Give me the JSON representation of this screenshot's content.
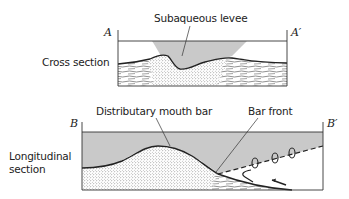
{
  "figure": {
    "cross_section": {
      "title": "Cross section",
      "left_marker": "A",
      "right_marker": "A′",
      "callout": "Subaqueous levee"
    },
    "longitudinal_section": {
      "title_line1": "Longitudinal",
      "title_line2": "section",
      "left_marker": "B",
      "right_marker": "B′",
      "callout_bar": "Distributary mouth bar",
      "callout_front": "Bar front"
    },
    "colors": {
      "water": "#c9c9c9",
      "sand_dots": "#555555",
      "line": "#222222",
      "background": "#ffffff"
    }
  }
}
